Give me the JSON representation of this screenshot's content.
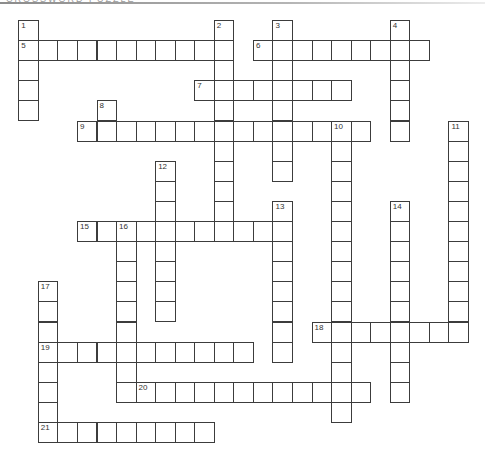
{
  "header": {
    "title": "CROSSWORD PUZZLE"
  },
  "grid_layout": {
    "origin_x": 18.3,
    "origin_y": 20,
    "col_pitch": 19.55,
    "row_pitch": 20.1,
    "border_color": "#3c3c3c",
    "cell_fill": "#ffffff"
  },
  "clues": [
    {
      "number": 1,
      "direction": "down",
      "col": 0,
      "row": 0,
      "length": 5
    },
    {
      "number": 2,
      "direction": "down",
      "col": 10,
      "row": 0,
      "length": 11
    },
    {
      "number": 3,
      "direction": "down",
      "col": 13,
      "row": 0,
      "length": 8
    },
    {
      "number": 4,
      "direction": "down",
      "col": 19,
      "row": 0,
      "length": 6
    },
    {
      "number": 5,
      "direction": "across",
      "col": 0,
      "row": 1,
      "length": 11
    },
    {
      "number": 6,
      "direction": "across",
      "col": 12,
      "row": 1,
      "length": 9
    },
    {
      "number": 7,
      "direction": "across",
      "col": 9,
      "row": 3,
      "length": 8
    },
    {
      "number": 8,
      "direction": "down",
      "col": 4,
      "row": 4,
      "length": 2
    },
    {
      "number": 9,
      "direction": "across",
      "col": 3,
      "row": 5,
      "length": 15
    },
    {
      "number": 10,
      "direction": "down",
      "col": 16,
      "row": 5,
      "length": 15
    },
    {
      "number": 11,
      "direction": "down",
      "col": 22,
      "row": 5,
      "length": 11
    },
    {
      "number": 12,
      "direction": "down",
      "col": 7,
      "row": 7,
      "length": 8
    },
    {
      "number": 13,
      "direction": "down",
      "col": 13,
      "row": 9,
      "length": 8
    },
    {
      "number": 14,
      "direction": "down",
      "col": 19,
      "row": 9,
      "length": 10
    },
    {
      "number": 15,
      "direction": "across",
      "col": 3,
      "row": 10,
      "length": 11
    },
    {
      "number": 16,
      "direction": "down",
      "col": 5,
      "row": 10,
      "length": 9
    },
    {
      "number": 17,
      "direction": "down",
      "col": 1,
      "row": 13,
      "length": 8
    },
    {
      "number": 18,
      "direction": "across",
      "col": 15,
      "row": 15,
      "length": 8
    },
    {
      "number": 19,
      "direction": "across",
      "col": 1,
      "row": 16,
      "length": 11
    },
    {
      "number": 20,
      "direction": "across",
      "col": 6,
      "row": 18,
      "length": 12
    },
    {
      "number": 21,
      "direction": "across",
      "col": 1,
      "row": 20,
      "length": 9
    }
  ]
}
